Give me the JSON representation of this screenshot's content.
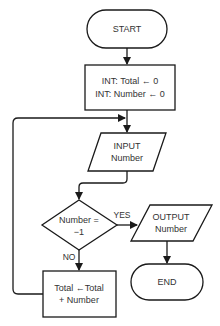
{
  "diagram": {
    "type": "flowchart",
    "nodes": {
      "start": {
        "kind": "terminal",
        "label": "START"
      },
      "init": {
        "kind": "process",
        "lines": [
          "INT: Total ← 0",
          "INT: Number ← 0"
        ]
      },
      "input": {
        "kind": "io",
        "lines": [
          "INPUT",
          "Number"
        ]
      },
      "decision": {
        "kind": "decision",
        "lines": [
          "Number =",
          "−1"
        ]
      },
      "output": {
        "kind": "io",
        "lines": [
          "OUTPUT",
          "Number"
        ]
      },
      "end": {
        "kind": "terminal",
        "label": "END"
      },
      "accumulate": {
        "kind": "process",
        "lines": [
          "Total ←Total",
          "+ Number"
        ]
      }
    },
    "edge_labels": {
      "yes": "YES",
      "no": "NO"
    },
    "edges": [
      {
        "from": "start",
        "to": "init"
      },
      {
        "from": "init",
        "to": "input"
      },
      {
        "from": "input",
        "to": "decision"
      },
      {
        "from": "decision",
        "to": "output",
        "label": "YES"
      },
      {
        "from": "decision",
        "to": "accumulate",
        "label": "NO"
      },
      {
        "from": "output",
        "to": "end"
      },
      {
        "from": "accumulate",
        "to": "input",
        "note": "loop back"
      }
    ],
    "colors": {
      "stroke": "#1a1a1a",
      "fill": "#ffffff",
      "text": "#333333"
    }
  }
}
